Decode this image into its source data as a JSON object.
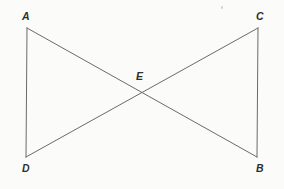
{
  "figure": {
    "background_color": "#fbfbfa",
    "line_color": "#6a6a6a",
    "label_color": "#2f2f2f",
    "line_width": 1,
    "width": 284,
    "height": 189,
    "type": "geometry-diagram"
  },
  "points": {
    "A": {
      "label": "A",
      "x": 27,
      "y": 28
    },
    "C": {
      "label": "C",
      "x": 258,
      "y": 28
    },
    "D": {
      "label": "D",
      "x": 26,
      "y": 157
    },
    "B": {
      "label": "B",
      "x": 257,
      "y": 157
    },
    "E": {
      "label": "E",
      "x": 143,
      "y": 92
    }
  },
  "segments": [
    {
      "name": "segment-AD",
      "from": "A",
      "to": "D",
      "x1": 27,
      "y1": 28,
      "x2": 26,
      "y2": 157
    },
    {
      "name": "segment-CB",
      "from": "C",
      "to": "B",
      "x1": 258,
      "y1": 28,
      "x2": 257,
      "y2": 157
    },
    {
      "name": "segment-AB",
      "from": "A",
      "to": "B",
      "x1": 27,
      "y1": 28,
      "x2": 257,
      "y2": 157
    },
    {
      "name": "segment-DC",
      "from": "D",
      "to": "C",
      "x1": 26,
      "y1": 157,
      "x2": 258,
      "y2": 28
    }
  ],
  "artifacts": {
    "speck": {
      "name": "scan-speck",
      "x": 221,
      "y": 6,
      "color": "#c9c9c9"
    }
  }
}
